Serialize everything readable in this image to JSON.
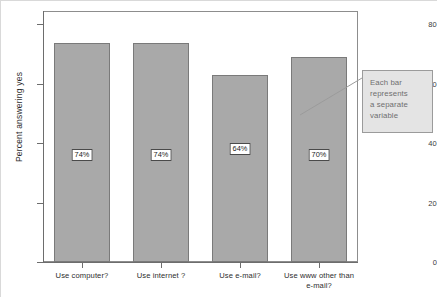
{
  "chart_data": {
    "type": "bar",
    "title": "",
    "subtitle": "",
    "xlabel": "",
    "ylabel": "Percent answering yes",
    "ylim": [
      0,
      80
    ],
    "grid": false,
    "legend": "none",
    "categories": [
      "Use computer?",
      "Use internet ?",
      "Use e-mail?",
      "Use www other than\ne-mail?"
    ],
    "values": [
      73.5,
      73.5,
      63,
      69
    ],
    "data_labels": [
      "74%",
      "74%",
      "64%",
      "70%"
    ],
    "y_ticks": [
      "0",
      "20",
      "40",
      "60",
      "80"
    ],
    "y_tick_values": [
      0,
      20,
      40,
      60,
      80
    ],
    "annotations": [
      {
        "text": "Each bar\nrepresents\na separate\nvariable",
        "target": "bar-4"
      }
    ],
    "colors": {
      "bar_fill": "#a9a9a9",
      "bar_stroke": "#7a7a7a",
      "axis": "#6d6d6d",
      "frame": "#8d8d8d",
      "annotation_fill": "#e4e4e4",
      "annotation_stroke": "#9b9b9b",
      "annotation_text": "#6f6f6f",
      "label_text": "#2d2d2d",
      "background": "#ffffff"
    }
  }
}
